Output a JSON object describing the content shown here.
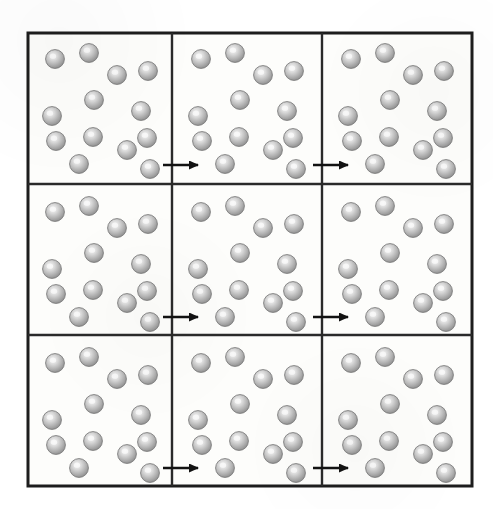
{
  "figure": {
    "background_color": "#ffffff"
  },
  "canvas": {
    "width": 493,
    "height": 509
  },
  "grid": {
    "rows": 3,
    "columns": 3,
    "x": 28,
    "y": 33,
    "width": 444,
    "height": 453,
    "cell_width": 148,
    "cell_height": 151,
    "outer_border_color": "#1d1d1d",
    "outer_border_width": 3,
    "inner_divider_color": "#2a2a2a",
    "inner_divider_width": 2.4,
    "cell_fill": "#fdfdfb",
    "vertical_dividers_x": [
      172,
      322
    ],
    "horizontal_dividers_y": [
      184,
      335
    ]
  },
  "particle": {
    "label": "sphere",
    "count_per_cell": 13,
    "radius": 9.4,
    "fill_center_color": "#f2f2f2",
    "fill_mid_color": "#b9b9b9",
    "fill_edge_color": "#8e8e8e",
    "outline_color": "#7d7d7d",
    "highlight_offset": "upper-left"
  },
  "particle_layout": [
    {
      "id": "p1",
      "x": 27,
      "y": 26
    },
    {
      "id": "p2",
      "x": 61,
      "y": 20
    },
    {
      "id": "p3",
      "x": 89,
      "y": 42
    },
    {
      "id": "p4",
      "x": 120,
      "y": 38
    },
    {
      "id": "p5",
      "x": 66,
      "y": 67
    },
    {
      "id": "p6",
      "x": 113,
      "y": 78
    },
    {
      "id": "p7",
      "x": 24,
      "y": 83
    },
    {
      "id": "p8",
      "x": 28,
      "y": 108
    },
    {
      "id": "p9",
      "x": 65,
      "y": 104
    },
    {
      "id": "p10",
      "x": 99,
      "y": 117
    },
    {
      "id": "p11",
      "x": 119,
      "y": 105
    },
    {
      "id": "p12",
      "x": 51,
      "y": 131
    },
    {
      "id": "p13",
      "x": 122,
      "y": 136
    }
  ],
  "arrows": {
    "color": "#121212",
    "shaft_width": 2.6,
    "head_length": 9,
    "head_half_width": 4.5,
    "length": 44,
    "items": [
      {
        "id": "arrow-r1-c1-c2",
        "row": 1,
        "from_column": 1,
        "to_column": 2,
        "x1": 163,
        "x2": 207,
        "y": 165
      },
      {
        "id": "arrow-r1-c2-c3",
        "row": 1,
        "from_column": 2,
        "to_column": 3,
        "x1": 313,
        "x2": 357,
        "y": 165
      },
      {
        "id": "arrow-r2-c1-c2",
        "row": 2,
        "from_column": 1,
        "to_column": 2,
        "x1": 163,
        "x2": 207,
        "y": 317
      },
      {
        "id": "arrow-r2-c2-c3",
        "row": 2,
        "from_column": 2,
        "to_column": 3,
        "x1": 313,
        "x2": 357,
        "y": 317
      },
      {
        "id": "arrow-r3-c1-c2",
        "row": 3,
        "from_column": 1,
        "to_column": 2,
        "x1": 163,
        "x2": 207,
        "y": 468
      },
      {
        "id": "arrow-r3-c2-c3",
        "row": 3,
        "from_column": 2,
        "to_column": 3,
        "x1": 313,
        "x2": 357,
        "y": 468
      }
    ]
  },
  "cells": [
    {
      "id": "cell-r1-c1",
      "row": 1,
      "column": 1,
      "x": 28,
      "y": 33,
      "particle_count": 13
    },
    {
      "id": "cell-r1-c2",
      "row": 1,
      "column": 2,
      "x": 174,
      "y": 33,
      "particle_count": 13
    },
    {
      "id": "cell-r1-c3",
      "row": 1,
      "column": 3,
      "x": 324,
      "y": 33,
      "particle_count": 13
    },
    {
      "id": "cell-r2-c1",
      "row": 2,
      "column": 1,
      "x": 28,
      "y": 186,
      "particle_count": 13
    },
    {
      "id": "cell-r2-c2",
      "row": 2,
      "column": 2,
      "x": 174,
      "y": 186,
      "particle_count": 13
    },
    {
      "id": "cell-r2-c3",
      "row": 2,
      "column": 3,
      "x": 324,
      "y": 186,
      "particle_count": 13
    },
    {
      "id": "cell-r3-c1",
      "row": 3,
      "column": 1,
      "x": 28,
      "y": 337,
      "particle_count": 13
    },
    {
      "id": "cell-r3-c2",
      "row": 3,
      "column": 2,
      "x": 174,
      "y": 337,
      "particle_count": 13
    },
    {
      "id": "cell-r3-c3",
      "row": 3,
      "column": 3,
      "x": 324,
      "y": 337,
      "particle_count": 13
    }
  ]
}
